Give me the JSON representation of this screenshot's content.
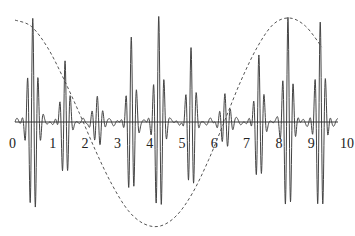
{
  "chart_data": {
    "type": "line",
    "title": "",
    "xlabel": "",
    "ylabel": "",
    "xlim": [
      0,
      10
    ],
    "ylim": [
      -1.1,
      1.1
    ],
    "grid": false,
    "legend": null,
    "x_ticks": [
      "0",
      "1",
      "2",
      "3",
      "4",
      "5",
      "6",
      "7",
      "8",
      "9",
      "10"
    ],
    "series": [
      {
        "name": "signal",
        "style": "solid",
        "description": "oscillatory bursts (wavelet packets) centered on the axis; large spikes near x=0.6, 1.7, 3.6, 4.5, 5.6, 7.6, 8.5, 9.5",
        "bursts": [
          {
            "center": 0.55,
            "amp": 1.0,
            "width": 0.18,
            "freq": 6.0
          },
          {
            "center": 1.55,
            "amp": 0.6,
            "width": 0.16,
            "freq": 6.0
          },
          {
            "center": 3.6,
            "amp": 0.8,
            "width": 0.16,
            "freq": 6.0
          },
          {
            "center": 4.45,
            "amp": 1.0,
            "width": 0.17,
            "freq": 6.0
          },
          {
            "center": 5.45,
            "amp": 0.72,
            "width": 0.16,
            "freq": 6.0
          },
          {
            "center": 7.55,
            "amp": 0.65,
            "width": 0.16,
            "freq": 6.0
          },
          {
            "center": 8.45,
            "amp": 1.0,
            "width": 0.17,
            "freq": 6.0
          },
          {
            "center": 9.45,
            "amp": 1.0,
            "width": 0.17,
            "freq": 6.0
          },
          {
            "center": 2.55,
            "amp": 0.22,
            "width": 0.2,
            "freq": 6.0
          },
          {
            "center": 6.5,
            "amp": 0.25,
            "width": 0.2,
            "freq": 6.0
          }
        ]
      },
      {
        "name": "envelope",
        "style": "dashed",
        "description": "cosine-like curve: max near x=0, min near x=4.4, max near x=8.3",
        "x": [
          0,
          0.5,
          1,
          1.5,
          2,
          2.5,
          3,
          3.5,
          4,
          4.5,
          5,
          5.5,
          6,
          6.5,
          7,
          7.5,
          8,
          8.5,
          9,
          9.5
        ],
        "y": [
          0.98,
          0.92,
          0.72,
          0.42,
          0.08,
          -0.28,
          -0.6,
          -0.85,
          -0.98,
          -1.0,
          -0.9,
          -0.68,
          -0.36,
          0.02,
          0.4,
          0.72,
          0.94,
          1.0,
          0.92,
          0.72
        ]
      }
    ]
  }
}
